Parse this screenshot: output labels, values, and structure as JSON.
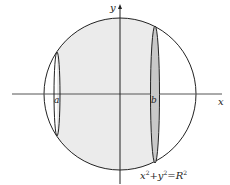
{
  "diagram": {
    "axes": {
      "x_label": "x",
      "y_label": "y"
    },
    "points": {
      "a_label": "a",
      "b_label": "b"
    },
    "equation": {
      "x": "x",
      "x_exp": "2",
      "plus": "+",
      "y": "y",
      "y_exp": "2",
      "eq": "=",
      "R": "R",
      "R_exp": "2"
    },
    "colors": {
      "shade": "#ebebeb",
      "band": "#c8c8c8",
      "stroke": "#222222"
    }
  }
}
